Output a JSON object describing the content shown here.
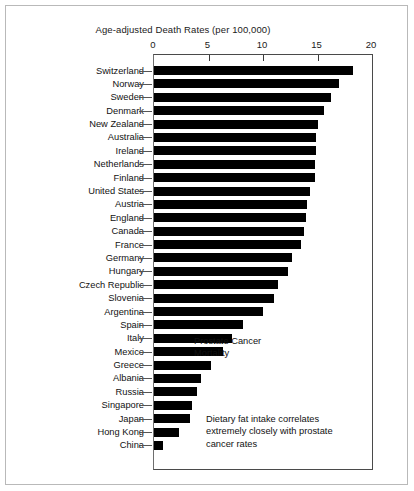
{
  "figure": {
    "axis_title": "Age-adjusted Death Rates (per 100,000)",
    "annotation_title": "Prostate Cancer\nMortality",
    "annotation_note": "Dietary fat intake correlates\nextremely closely with prostate\ncancer rates"
  },
  "chart_data": {
    "type": "bar",
    "orientation": "horizontal",
    "title": "Prostate Cancer Mortality",
    "xlabel": "Age-adjusted Death Rates (per 100,000)",
    "ylabel": "",
    "xlim": [
      0,
      20
    ],
    "xticks": [
      0,
      5,
      10,
      15,
      20
    ],
    "grid": false,
    "legend": null,
    "bar_color": "#000000",
    "annotations": [
      "Prostate Cancer Mortality",
      "Dietary fat intake correlates extremely closely with prostate cancer rates"
    ],
    "categories": [
      "Switzerland",
      "Norway",
      "Sweden",
      "Denmark",
      "New Zealand",
      "Australia",
      "Ireland",
      "Netherlands",
      "Finland",
      "United States",
      "Austria",
      "England",
      "Canada",
      "France",
      "Germany",
      "Hungary",
      "Czech Republic",
      "Slovenia",
      "Argentina",
      "Spain",
      "Italy",
      "Mexico",
      "Greece",
      "Albania",
      "Russia",
      "Singapore",
      "Japan",
      "Hong Kong",
      "China"
    ],
    "values": [
      18.3,
      17.0,
      16.2,
      15.6,
      15.0,
      14.9,
      14.9,
      14.8,
      14.8,
      14.3,
      14.0,
      13.9,
      13.8,
      13.5,
      12.7,
      12.3,
      11.4,
      11.0,
      10.0,
      8.2,
      7.2,
      6.3,
      5.2,
      4.3,
      3.9,
      3.5,
      3.3,
      2.3,
      0.8
    ]
  }
}
